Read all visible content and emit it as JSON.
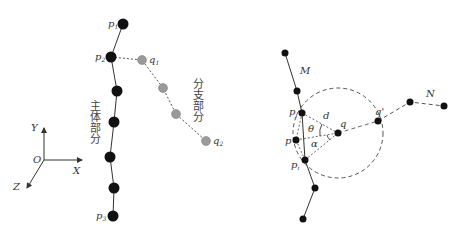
{
  "left_panel": {
    "axes": {
      "x_label": "X",
      "y_label": "Y",
      "z_label": "Z",
      "origin_label": "O"
    },
    "main_body_label": "主体部分",
    "branch_label": "分支部分",
    "main_points": [
      {
        "x": 123,
        "y": 24,
        "label": "p",
        "sub": "1"
      },
      {
        "x": 111,
        "y": 57,
        "label": "p",
        "sub": "2"
      },
      {
        "x": 117,
        "y": 91
      },
      {
        "x": 114,
        "y": 122
      },
      {
        "x": 110,
        "y": 157
      },
      {
        "x": 114,
        "y": 188
      },
      {
        "x": 113,
        "y": 216,
        "label": "p",
        "sub": "3"
      }
    ],
    "branch_points": [
      {
        "x": 142,
        "y": 60,
        "label": "q",
        "sub": "1"
      },
      {
        "x": 163,
        "y": 88
      },
      {
        "x": 176,
        "y": 114
      },
      {
        "x": 206,
        "y": 141,
        "label": "q",
        "sub": "2"
      }
    ],
    "colors": {
      "main": "#111111",
      "branch": "#999999"
    }
  },
  "right_panel": {
    "chain_M_label": "M",
    "chain_N_label": "N",
    "points": {
      "pj": {
        "label": "p",
        "sub": "j"
      },
      "pi": {
        "label": "p",
        "sub": "i"
      },
      "p": {
        "label": "p"
      },
      "q": {
        "label": "q"
      },
      "q_prime": {
        "label": "q'"
      }
    },
    "distance_label": "d",
    "angle_theta": "θ",
    "angle_alpha": "α"
  }
}
